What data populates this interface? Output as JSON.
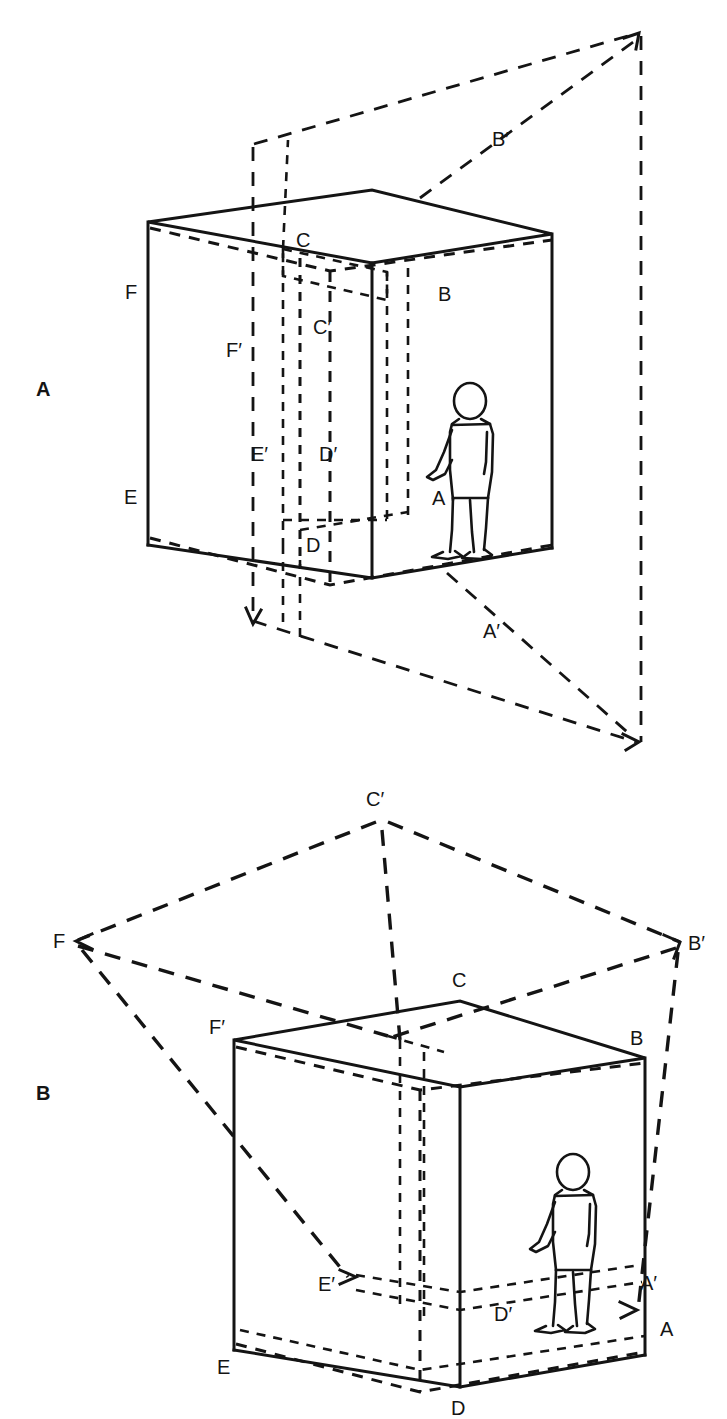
{
  "figure": {
    "caption": "",
    "panels": [
      {
        "id": "A",
        "letter": "A",
        "description": "cube with observer and outer projection frame"
      },
      {
        "id": "B",
        "letter": "B",
        "description": "cube with observer and radiating projection rays"
      }
    ]
  },
  "panel_a": {
    "letter": "A",
    "labels": {
      "F": "F",
      "C": "C",
      "B": "B",
      "B_prime": "B′",
      "F_prime": "F′",
      "C_prime": "C′",
      "E_prime": "E′",
      "D_prime": "D′",
      "E": "E",
      "D": "D",
      "A": "A",
      "A_prime": "A′"
    },
    "figure_person": "standing-walking-person"
  },
  "panel_b": {
    "letter": "B",
    "labels": {
      "C_prime": "C′",
      "F": "F",
      "B_prime": "B′",
      "C": "C",
      "F_prime": "F′",
      "B": "B",
      "E_prime": "E′",
      "D_prime": "D′",
      "A_prime": "A′",
      "E": "E",
      "D": "D",
      "A": "A"
    },
    "figure_person": "standing-walking-person"
  },
  "colors": {
    "ink": "#141414",
    "background": "#ffffff"
  }
}
